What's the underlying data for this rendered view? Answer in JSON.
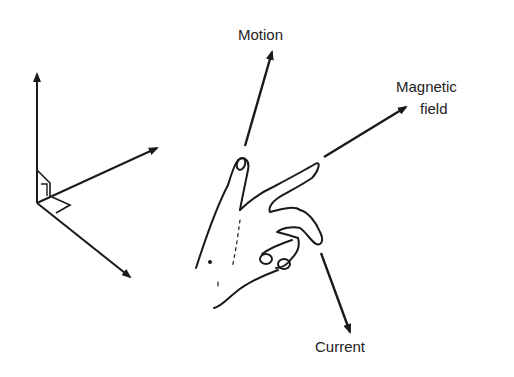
{
  "diagram": {
    "labels": {
      "motion": "Motion",
      "magnetic_line1": "Magnetic",
      "magnetic_line2": "field",
      "current": "Current"
    },
    "colors": {
      "ink": "#1a1a1a",
      "text": "#222222",
      "background": "#ffffff"
    }
  }
}
